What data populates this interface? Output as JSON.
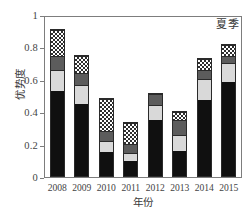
{
  "chart_data": {
    "type": "bar",
    "subtype": "stacked-bar",
    "title": "",
    "annotation": "夏季",
    "xlabel": "年份",
    "ylabel": "优势度",
    "categories": [
      "2008",
      "2009",
      "2010",
      "2011",
      "2012",
      "2013",
      "2014",
      "2015"
    ],
    "ylim": [
      0,
      1
    ],
    "yticks": [
      "0",
      "0.2",
      "0.4",
      "0.6",
      "0.8",
      "1"
    ],
    "ytick_values": [
      0,
      0.2,
      0.4,
      0.6,
      0.8,
      1
    ],
    "grid": false,
    "legend": "none",
    "series": [
      {
        "name": "segment-black",
        "fill": "solid-black",
        "color": "#101010",
        "values": [
          0.53,
          0.45,
          0.15,
          0.095,
          0.35,
          0.155,
          0.475,
          0.585
        ]
      },
      {
        "name": "segment-light-gray",
        "fill": "solid-light-gray",
        "color": "#d9d9d9",
        "values": [
          0.125,
          0.115,
          0.065,
          0.045,
          0.09,
          0.095,
          0.125,
          0.115
        ]
      },
      {
        "name": "segment-dark-gray",
        "fill": "solid-dark-gray",
        "color": "#5c5c5c",
        "values": [
          0.085,
          0.065,
          0.055,
          0.05,
          0.06,
          0.085,
          0.05,
          0.04
        ]
      },
      {
        "name": "segment-checkered",
        "fill": "checkerboard",
        "color": "#ffffff",
        "values": [
          0.155,
          0.1,
          0.19,
          0.12,
          0.0,
          0.045,
          0.06,
          0.06
        ]
      }
    ],
    "totals": [
      0.895,
      0.73,
      0.46,
      0.31,
      0.5,
      0.38,
      0.71,
      0.8
    ]
  },
  "axes": {
    "y_title": "优势度",
    "x_title": "年份",
    "y_tick_labels": [
      "1",
      "0.8",
      "0.6",
      "0.4",
      "0.2",
      "0"
    ],
    "x_tick_labels": [
      "2008",
      "2009",
      "2010",
      "2011",
      "2012",
      "2013",
      "2014",
      "2015"
    ]
  },
  "annotation": {
    "season_label": "夏季"
  }
}
